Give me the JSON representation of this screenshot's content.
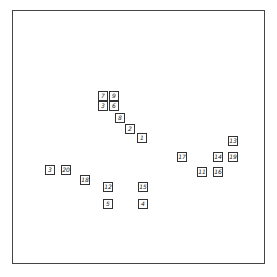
{
  "diagram": {
    "type": "scatter-labels",
    "nodes": [
      {
        "label": "7",
        "x": 103,
        "y": 96
      },
      {
        "label": "9",
        "x": 114,
        "y": 96
      },
      {
        "label": "3",
        "x": 103,
        "y": 106
      },
      {
        "label": "6",
        "x": 114,
        "y": 106
      },
      {
        "label": "8",
        "x": 120,
        "y": 118
      },
      {
        "label": "2",
        "x": 130,
        "y": 129
      },
      {
        "label": "1",
        "x": 142,
        "y": 138
      },
      {
        "label": "3",
        "x": 50,
        "y": 170
      },
      {
        "label": "20",
        "x": 66,
        "y": 170
      },
      {
        "label": "18",
        "x": 85,
        "y": 180
      },
      {
        "label": "12",
        "x": 108,
        "y": 187
      },
      {
        "label": "15",
        "x": 143,
        "y": 187
      },
      {
        "label": "5",
        "x": 108,
        "y": 204
      },
      {
        "label": "4",
        "x": 143,
        "y": 204
      },
      {
        "label": "13",
        "x": 233,
        "y": 141
      },
      {
        "label": "17",
        "x": 182,
        "y": 157
      },
      {
        "label": "14",
        "x": 218,
        "y": 157
      },
      {
        "label": "19",
        "x": 233,
        "y": 157
      },
      {
        "label": "11",
        "x": 202,
        "y": 172
      },
      {
        "label": "16",
        "x": 218,
        "y": 172
      }
    ]
  }
}
